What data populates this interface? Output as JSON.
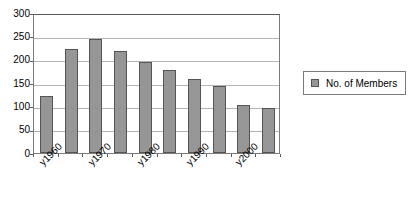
{
  "chart_data": {
    "type": "bar",
    "title": "",
    "xlabel": "",
    "ylabel": "",
    "categories": [
      "y1960",
      "y1965",
      "y1970",
      "y1975",
      "y1980",
      "y1985",
      "y1990",
      "y1995",
      "y2000",
      "y2005"
    ],
    "visible_tick_labels": [
      "y1960",
      "y1970",
      "y1980",
      "y1990",
      "y2000"
    ],
    "values": [
      123,
      222,
      245,
      218,
      195,
      177,
      158,
      143,
      103,
      97
    ],
    "series": [
      {
        "name": "No. of Members",
        "values": [
          123,
          222,
          245,
          218,
          195,
          177,
          158,
          143,
          103,
          97
        ]
      }
    ],
    "ylim": [
      0,
      300
    ],
    "ytick_labels": [
      "300",
      "250",
      "200",
      "150",
      "100",
      "50",
      "0"
    ],
    "ytick_values": [
      300,
      250,
      200,
      150,
      100,
      50,
      0
    ],
    "grid": true,
    "legend_position": "right",
    "colors": {
      "bar_fill": "#969696",
      "bar_border": "#545454",
      "gridline": "#b4b4b4",
      "axis": "#7b7b7b",
      "background": "#ffffff",
      "text": "#000000"
    }
  },
  "legend": {
    "entries": [
      {
        "label": "No. of Members",
        "swatch_color": "#969696"
      }
    ]
  }
}
